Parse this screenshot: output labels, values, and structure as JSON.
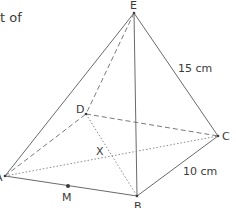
{
  "text_fragment": "t of",
  "figure": {
    "type": "square-based pyramid",
    "vertices": {
      "A": {
        "label": "A",
        "x": 5,
        "y": 176
      },
      "B": {
        "label": "B",
        "x": 137,
        "y": 196
      },
      "C": {
        "label": "C",
        "x": 218,
        "y": 136
      },
      "D": {
        "label": "D",
        "x": 86,
        "y": 114
      },
      "E": {
        "label": "E",
        "x": 134,
        "y": 13
      },
      "M": {
        "label": "M",
        "x": 68,
        "y": 186
      },
      "X": {
        "label": "X"
      }
    },
    "measurements": {
      "EC": "15 cm",
      "BC": "10 cm"
    },
    "colors": {
      "line": "#6a6a6a",
      "text": "#3a3a3a"
    }
  }
}
